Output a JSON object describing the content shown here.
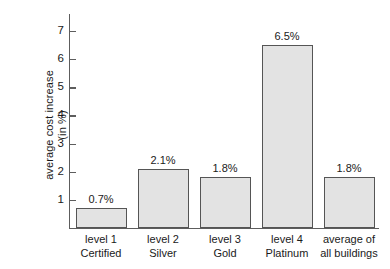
{
  "chart_data": {
    "type": "bar",
    "title": "",
    "subtitle": "",
    "xlabel": "",
    "ylabel": "average cost increase (in %)",
    "ylabel_line1": "average cost increase",
    "ylabel_line2": "(in %)",
    "ylim": [
      0,
      7.6
    ],
    "yticks": [
      1,
      2,
      3,
      4,
      5,
      6,
      7
    ],
    "ytick_labels": [
      "1",
      "2",
      "3",
      "4",
      "5",
      "6",
      "7"
    ],
    "grid": false,
    "legend": false,
    "categories": [
      "level 1 Certified",
      "level 2 Silver",
      "level 3 Gold",
      "level 4 Platinum",
      "average of all buildings"
    ],
    "category_lines": [
      [
        "level 1",
        "Certified"
      ],
      [
        "level 2",
        "Silver"
      ],
      [
        "level 3",
        "Gold"
      ],
      [
        "level 4",
        "Platinum"
      ],
      [
        "average of",
        "all buildings"
      ]
    ],
    "values": [
      0.7,
      2.1,
      1.8,
      6.5,
      1.8
    ],
    "data_labels": [
      "0.7%",
      "2.1%",
      "1.8%",
      "6.5%",
      "1.8%"
    ],
    "bar_fill_color": "#e3e3e3",
    "bar_edge_color": "#555555",
    "axis_color": "#5d5d5d",
    "text_color": "#1a1a1a",
    "background_color": "#ffffff"
  }
}
